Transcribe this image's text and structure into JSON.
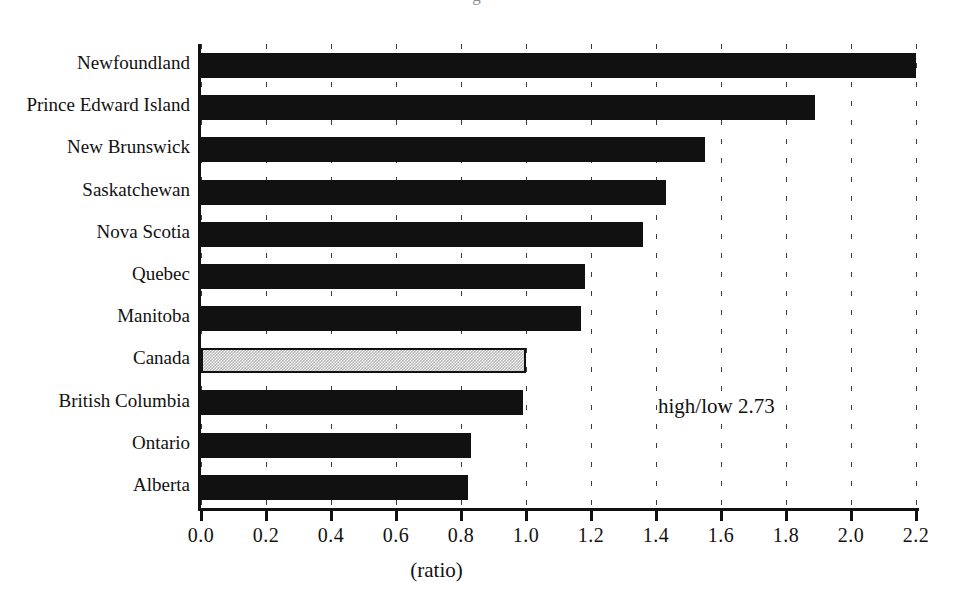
{
  "figure": {
    "cutoff_title": "g",
    "annotation": "high/low 2.73",
    "xaxis_title": "(ratio)"
  },
  "chart_data": {
    "type": "bar",
    "orientation": "horizontal",
    "title": "",
    "xlabel": "(ratio)",
    "ylabel": "",
    "xlim": [
      0.0,
      2.2
    ],
    "grid": true,
    "legend": "none",
    "annotations": [
      "high/low 2.73"
    ],
    "xticks": [
      "0.0",
      "0.2",
      "0.4",
      "0.6",
      "0.8",
      "1.0",
      "1.2",
      "1.4",
      "1.6",
      "1.8",
      "2.0",
      "2.2"
    ],
    "xtick_values": [
      0.0,
      0.2,
      0.4,
      0.6,
      0.8,
      1.0,
      1.2,
      1.4,
      1.6,
      1.8,
      2.0,
      2.2
    ],
    "categories": [
      "Newfoundland",
      "Prince Edward Island",
      "New Brunswick",
      "Saskatchewan",
      "Nova Scotia",
      "Quebec",
      "Manitoba",
      "Canada",
      "British Columbia",
      "Ontario",
      "Alberta"
    ],
    "values": [
      2.2,
      1.89,
      1.55,
      1.43,
      1.36,
      1.18,
      1.17,
      1.0,
      0.99,
      0.83,
      0.82
    ],
    "highlight_category": "Canada",
    "colors": {
      "bar": "#111111",
      "highlight_bar": "#b9b9b9",
      "axis": "#111111",
      "grid": "#3a3a3a",
      "background": "#ffffff"
    }
  }
}
